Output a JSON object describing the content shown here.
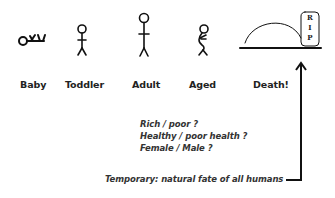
{
  "stages": [
    {
      "id": "baby",
      "label": "Baby",
      "icon": "baby-lying-icon"
    },
    {
      "id": "toddler",
      "label": "Toddler",
      "icon": "toddler-stick-figure-icon"
    },
    {
      "id": "adult",
      "label": "Adult",
      "icon": "adult-stick-figure-icon"
    },
    {
      "id": "aged",
      "label": "Aged",
      "icon": "aged-stooped-figure-icon"
    },
    {
      "id": "death",
      "label": "Death!",
      "icon": "grave-mound-icon"
    }
  ],
  "tombstone": {
    "letters": [
      "R",
      "I",
      "P"
    ]
  },
  "factors": [
    "Rich / poor ?",
    "Healthy / poor health ?",
    "Female / Male ?"
  ],
  "note": "Temporary: natural fate of all humans",
  "colors": {
    "stroke": "#111111",
    "text": "#222222"
  }
}
